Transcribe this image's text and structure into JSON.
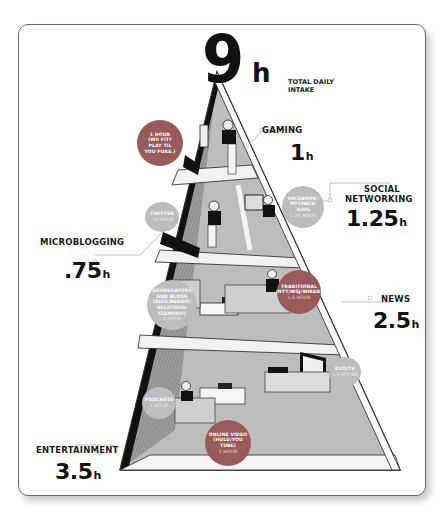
{
  "infographic": {
    "total": {
      "value": "9",
      "unit": "h",
      "label_line1": "TOTAL DAILY",
      "label_line2": "INTAKE"
    },
    "categories": [
      {
        "name": "GAMING",
        "value": "1",
        "unit": "h"
      },
      {
        "name_line1": "SOCIAL",
        "name_line2": "NETWORKING",
        "value": "1.25",
        "unit": "h"
      },
      {
        "name": "MICROBLOGGING",
        "value": ".75",
        "unit": "h"
      },
      {
        "name": "NEWS",
        "value": "2.5",
        "unit": "h"
      },
      {
        "name": "ENTERTAINMENT",
        "value": "3.5",
        "unit": "h"
      }
    ],
    "bubbles": [
      {
        "lines": [
          "1 HOUR",
          "(WII FIT?",
          "PLAY TIL",
          "YOU PUKE.)"
        ],
        "hours": ""
      },
      {
        "lines": [
          "TWITTER"
        ],
        "hours": ".75 HOUR"
      },
      {
        "lines": [
          "FACEBOOK/",
          "MYSPACE/",
          "NING"
        ],
        "hours": "1.25 HOUR"
      },
      {
        "lines": [
          "AGGREGATORS",
          "AND BLOGS",
          "(DIGG/REDDIT/",
          "DELICIOUS/",
          "GIZMODO)"
        ],
        "hours": "1 HOUR"
      },
      {
        "lines": [
          "TRADITIONAL",
          "(NYT/WSJ/WIRED)"
        ],
        "hours": "1.5 HOUR"
      },
      {
        "lines": [
          "DVD/TV"
        ],
        "hours": "1.5 HOURS"
      },
      {
        "lines": [
          "PODCASTS"
        ],
        "hours": "1 HOUR"
      },
      {
        "lines": [
          "ONLINE VIDEO",
          "(HULU/YOU TUBE)"
        ],
        "hours": "1 HOUR"
      }
    ],
    "colors": {
      "bubble_red": "#9a5a5a",
      "bubble_grey": "#bdbdbd",
      "ink": "#111111",
      "pyramid_grey": "#b8b8b8"
    }
  }
}
